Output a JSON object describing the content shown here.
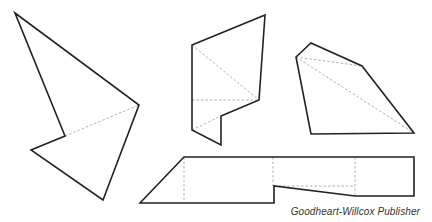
{
  "diagram": {
    "colors": {
      "outline": "#222222",
      "fold_line": "#a8a8a8",
      "background": "#ffffff"
    },
    "shapes": [
      {
        "id": "shape-left",
        "outline": "15,13 139,105 103,200 31,150 65,136",
        "folds": [
          "65,136 139,105"
        ]
      },
      {
        "id": "shape-middle",
        "outline": "192,45 265,15 259,100 221,116 221,145 192,130",
        "folds": [
          "192,45 259,100",
          "192,100 259,100",
          "192,130 221,116"
        ]
      },
      {
        "id": "shape-right",
        "outline": "296,57 311,43 362,66 414,133 311,134",
        "folds": [
          "296,57 362,66",
          "296,57 414,133"
        ]
      },
      {
        "id": "shape-bottom",
        "outline": "140,203 184,157 414,157 414,196 355,196 274,186 274,203",
        "folds": [
          "184,157 184,203",
          "273,157 273,186",
          "355,157 355,196",
          "274,186 355,186"
        ]
      }
    ]
  },
  "credit": "Goodheart-Willcox Publisher"
}
